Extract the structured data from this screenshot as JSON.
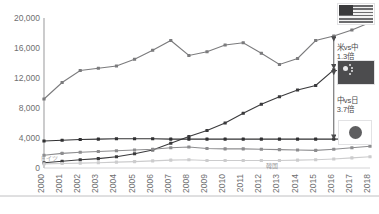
{
  "chart_data": {
    "type": "line",
    "title": "",
    "subtitle": "",
    "xlabel": "",
    "ylabel": "",
    "ylim": [
      0,
      20000
    ],
    "yticks": [
      "0",
      "4,000",
      "8,000",
      "12,000",
      "16,000",
      "20,000"
    ],
    "ytick_values": [
      0,
      4000,
      8000,
      12000,
      16000,
      20000
    ],
    "grid": false,
    "legend_position": "right-flags",
    "categories": [
      "2000",
      "2001",
      "2002",
      "2003",
      "2004",
      "2005",
      "2006",
      "2007",
      "2008",
      "2009",
      "2010",
      "2011",
      "2012",
      "2013",
      "2014",
      "2015",
      "2016",
      "2017",
      "2018"
    ],
    "series": [
      {
        "name": "米国",
        "legend_icon": "us-flag",
        "color": "#7b7b7d",
        "values": [
          9200,
          11400,
          13000,
          13300,
          13600,
          14500,
          15700,
          17000,
          15000,
          15500,
          16400,
          16700,
          15300,
          13800,
          14600,
          17000,
          17600,
          18400,
          19400
        ]
      },
      {
        "name": "中国",
        "legend_icon": "cn-flag",
        "color": "#3a3a3c",
        "values": [
          700,
          900,
          1100,
          1250,
          1500,
          1900,
          2400,
          3300,
          4200,
          5000,
          6000,
          7300,
          8500,
          9500,
          10400,
          11000,
          13100,
          12400,
          13000
        ]
      },
      {
        "name": "日本",
        "legend_icon": "jp-flag",
        "color": "#303032",
        "values": [
          3600,
          3700,
          3800,
          3850,
          3900,
          3900,
          3900,
          3850,
          3850,
          3850,
          3850,
          3850,
          3850,
          3850,
          3850,
          3850,
          3850,
          3900,
          4150
        ]
      },
      {
        "name": "ドイツ",
        "legend_icon": "none",
        "color": "#8d8d8f",
        "values": [
          1700,
          1950,
          2100,
          2200,
          2300,
          2400,
          2500,
          2700,
          2800,
          2600,
          2550,
          2550,
          2500,
          2450,
          2400,
          2350,
          2500,
          2700,
          2900
        ]
      },
      {
        "name": "韓国",
        "legend_icon": "none",
        "color": "#cccccd",
        "values": [
          550,
          600,
          650,
          700,
          780,
          850,
          950,
          1050,
          1100,
          1000,
          1000,
          1000,
          1000,
          1000,
          1050,
          1100,
          1200,
          1350,
          1500
        ]
      }
    ],
    "annotations": [
      {
        "id": "us-vs-cn",
        "line1": "米vs中",
        "line2": "1.3倍",
        "kind": "double-arrow"
      },
      {
        "id": "cn-vs-jp",
        "line1": "中vs日",
        "line2": "3.7倍",
        "kind": "double-arrow"
      }
    ],
    "inline_labels": [
      {
        "id": "germany-label",
        "text": "ドイツ"
      },
      {
        "id": "korea-label",
        "text": "韓国"
      }
    ]
  },
  "colors": {
    "axis": "#9d9d9f",
    "text": "#6f6f71",
    "annotation": "#4a4a4c"
  }
}
